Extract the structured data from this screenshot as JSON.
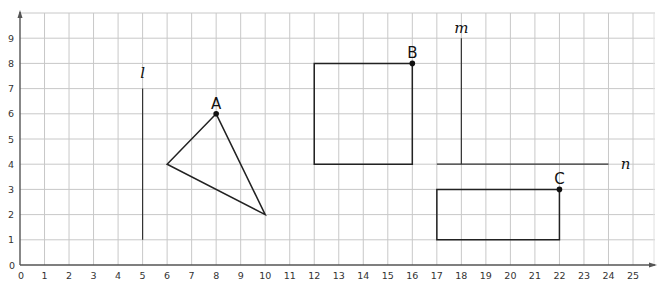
{
  "grid": {
    "x_min": 0,
    "x_max": 25,
    "y_min": 0,
    "y_max": 9,
    "origin_px": [
      20,
      265
    ],
    "unit_px_x": 24.52,
    "unit_px_y": 25.2,
    "top_px": 13,
    "right_px": 655,
    "gridline_color": "#c8c8c8",
    "axis_color": "#555555",
    "shape_color": "#222222",
    "x_ticks": [
      "0",
      "1",
      "2",
      "3",
      "4",
      "5",
      "6",
      "7",
      "8",
      "9",
      "10",
      "11",
      "12",
      "13",
      "14",
      "15",
      "16",
      "17",
      "18",
      "19",
      "20",
      "21",
      "22",
      "23",
      "24",
      "25"
    ],
    "y_ticks": [
      "0",
      "1",
      "2",
      "3",
      "4",
      "5",
      "6",
      "7",
      "8",
      "9"
    ]
  },
  "lines": [
    {
      "name": "l",
      "label": "l",
      "from": [
        5,
        1
      ],
      "to": [
        5,
        7
      ],
      "label_at": [
        5,
        7.6
      ]
    },
    {
      "name": "m",
      "label": "m",
      "from": [
        18,
        4
      ],
      "to": [
        18,
        9
      ],
      "label_at": [
        18,
        9.4
      ]
    },
    {
      "name": "n",
      "label": "n",
      "from": [
        17,
        4
      ],
      "to": [
        24,
        4
      ],
      "label_at": [
        24.7,
        4
      ]
    }
  ],
  "shapes": {
    "triangle": {
      "vertices": [
        [
          6,
          4
        ],
        [
          8,
          6
        ],
        [
          10,
          2
        ]
      ]
    },
    "square": {
      "vertices": [
        [
          12,
          4
        ],
        [
          16,
          4
        ],
        [
          16,
          8
        ],
        [
          12,
          8
        ]
      ]
    },
    "rectangle": {
      "vertices": [
        [
          17,
          1
        ],
        [
          22,
          1
        ],
        [
          22,
          3
        ],
        [
          17,
          3
        ]
      ]
    }
  },
  "points": [
    {
      "label": "A",
      "at": [
        8,
        6
      ]
    },
    {
      "label": "B",
      "at": [
        16,
        8
      ]
    },
    {
      "label": "C",
      "at": [
        22,
        3
      ]
    }
  ]
}
